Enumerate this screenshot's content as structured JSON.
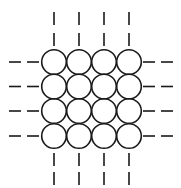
{
  "diagram": {
    "stroke_color": "#1a1a1a",
    "background": "#ffffff",
    "grid": {
      "rows": 4,
      "cols": 4,
      "col_centers": [
        54,
        79,
        104,
        129
      ],
      "row_centers": [
        62,
        86.5,
        111,
        136
      ],
      "radius": 12.3
    },
    "dashes": {
      "top": {
        "segments": [
          [
            12,
            25
          ],
          [
            33,
            46
          ]
        ]
      },
      "bottom": {
        "segments": [
          [
            153,
            166
          ],
          [
            172,
            185
          ]
        ]
      },
      "left": {
        "segments": [
          [
            9,
            21
          ],
          [
            27,
            39
          ]
        ]
      },
      "right": {
        "segments": [
          [
            143,
            155
          ],
          [
            161,
            173
          ]
        ]
      }
    }
  }
}
